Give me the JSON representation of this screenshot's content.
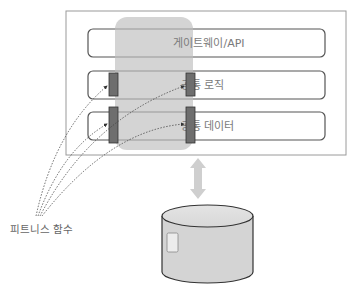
{
  "diagram": {
    "layers": [
      {
        "id": "gateway",
        "label": "게이트웨이/API"
      },
      {
        "id": "logic",
        "label": "공통 로직"
      },
      {
        "id": "data",
        "label": "공통 데이터"
      }
    ],
    "fitness_label": "피트니스 함수",
    "colors": {
      "outer_border": "#9a9a9a",
      "layer_border": "#555555",
      "overlay": "#c8c8c8",
      "marker": "#6e6e6e",
      "arrow": "#cfcfcf",
      "db_fill": "#d6d6d6",
      "text": "#7a7a7a"
    }
  }
}
